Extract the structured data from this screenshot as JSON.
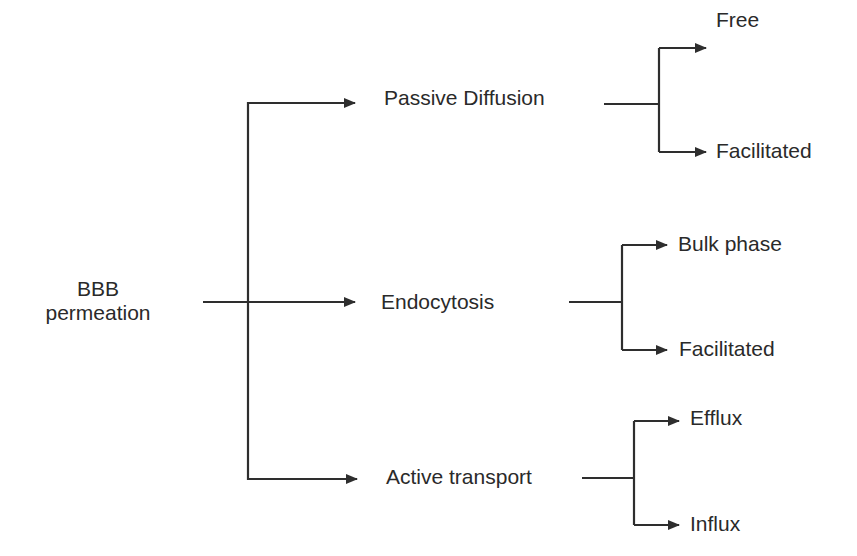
{
  "diagram": {
    "type": "tree",
    "colors": {
      "line": "#2e2e2e",
      "text": "#2a2a2a",
      "background": "#ffffff"
    },
    "root": {
      "line1": "BBB",
      "line2": "permeation"
    },
    "branches": [
      {
        "label": "Passive Diffusion",
        "children": [
          "Free",
          "Facilitated"
        ]
      },
      {
        "label": "Endocytosis",
        "children": [
          "Bulk phase",
          "Facilitated"
        ]
      },
      {
        "label": "Active transport",
        "children": [
          "Efflux",
          "Influx"
        ]
      }
    ]
  }
}
